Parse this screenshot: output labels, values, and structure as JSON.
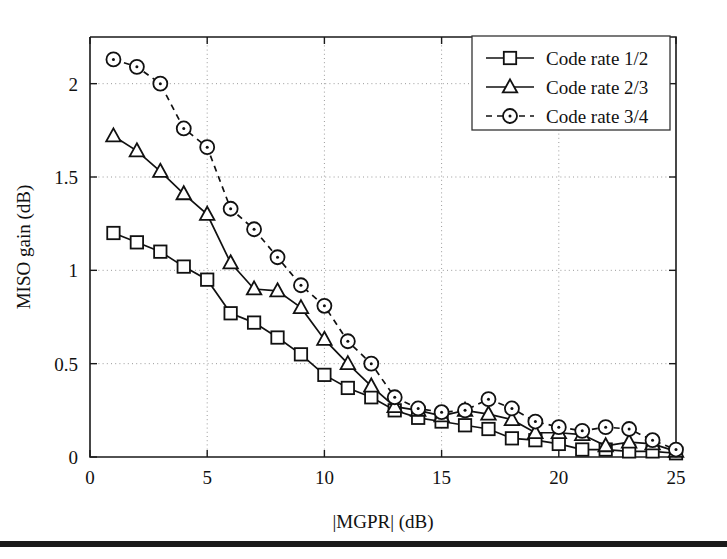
{
  "chart_data": {
    "type": "line",
    "title": "",
    "xlabel": "|MGPR| (dB)",
    "ylabel": "MISO gain (dB)",
    "xlim": [
      0,
      25
    ],
    "ylim": [
      0,
      2.25
    ],
    "xticks": [
      0,
      5,
      10,
      15,
      20,
      25
    ],
    "yticks": [
      0,
      0.5,
      1,
      1.5,
      2
    ],
    "xticklabels": [
      "0",
      "5",
      "10",
      "15",
      "20",
      "25"
    ],
    "yticklabels": [
      "0",
      "0.5",
      "1",
      "1.5",
      "2"
    ],
    "grid": true,
    "grid_style": "dotted",
    "legend_position": "upper right",
    "x": [
      1,
      2,
      3,
      4,
      5,
      6,
      7,
      8,
      9,
      10,
      11,
      12,
      13,
      14,
      15,
      16,
      17,
      18,
      19,
      20,
      21,
      22,
      23,
      24,
      25
    ],
    "series": [
      {
        "name": "Code rate 1/2",
        "marker": "square",
        "linestyle": "solid",
        "values": [
          1.2,
          1.15,
          1.1,
          1.02,
          0.95,
          0.77,
          0.72,
          0.64,
          0.55,
          0.44,
          0.37,
          0.32,
          0.25,
          0.21,
          0.19,
          0.17,
          0.15,
          0.1,
          0.09,
          0.07,
          0.04,
          0.04,
          0.03,
          0.03,
          0.02
        ]
      },
      {
        "name": "Code rate 2/3",
        "marker": "triangle",
        "linestyle": "solid",
        "values": [
          1.72,
          1.64,
          1.53,
          1.41,
          1.3,
          1.04,
          0.9,
          0.89,
          0.8,
          0.63,
          0.5,
          0.38,
          0.27,
          0.25,
          0.22,
          0.25,
          0.23,
          0.2,
          0.13,
          0.13,
          0.12,
          0.06,
          0.08,
          0.07,
          0.03
        ]
      },
      {
        "name": "Code rate 3/4",
        "marker": "circle",
        "linestyle": "dashed",
        "values": [
          2.13,
          2.09,
          2.0,
          1.76,
          1.66,
          1.33,
          1.22,
          1.07,
          0.92,
          0.81,
          0.62,
          0.5,
          0.32,
          0.26,
          0.24,
          0.25,
          0.31,
          0.26,
          0.19,
          0.16,
          0.14,
          0.16,
          0.15,
          0.09,
          0.04
        ]
      }
    ]
  },
  "legend": {
    "entries": [
      {
        "label": "Code rate 1/2",
        "marker": "square",
        "linestyle": "solid"
      },
      {
        "label": "Code rate 2/3",
        "marker": "triangle",
        "linestyle": "solid"
      },
      {
        "label": "Code rate 3/4",
        "marker": "circle",
        "linestyle": "dashed"
      }
    ]
  },
  "colors": {
    "line": "#111111",
    "marker_fill": "#ffffff",
    "grid": "#9a9a9a",
    "axis": "#1a1a1a",
    "background": "#ffffff"
  }
}
